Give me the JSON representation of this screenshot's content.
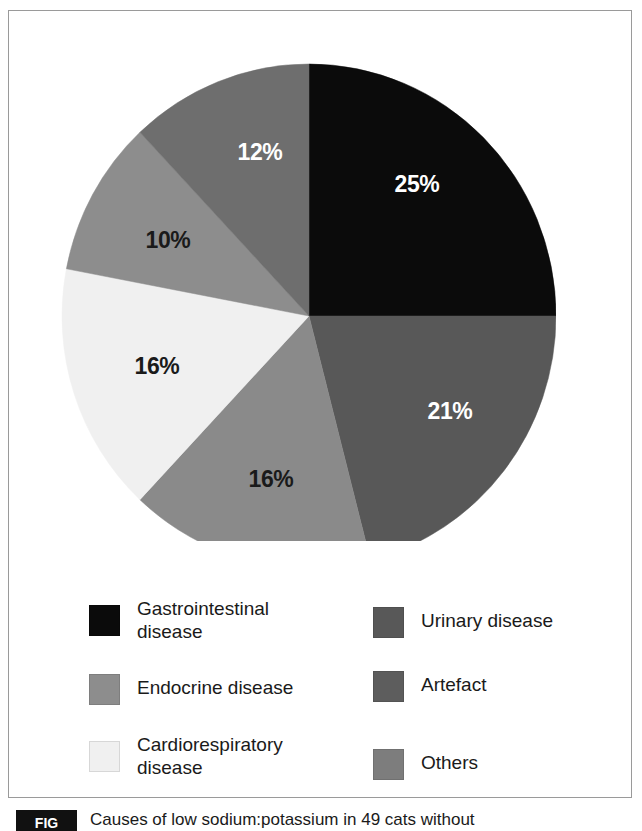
{
  "figure": {
    "caption_tag": "FIG",
    "caption_text": "Causes of low sodium:potassium in 49 cats without"
  },
  "colors": {
    "gastrointestinal": "#0b0b0b",
    "urinary": "#585858",
    "artefact": "#8a8a8a",
    "cardiorespiratory": "#f0f0f0",
    "endocrine": "#8d8d8d",
    "others": "#6e6e6e",
    "frame": "#9a9a9a",
    "label_on_dark": "#ffffff",
    "label_on_light": "#1a1a1a"
  },
  "chart_data": {
    "type": "pie",
    "title": "Causes of low sodium:potassium in 49 cats without",
    "xlabel": "",
    "ylabel": "",
    "grid": false,
    "legend_position": "bottom",
    "start_angle_deg": 0,
    "direction": "clockwise",
    "total_label": "100%",
    "labels": [
      "Gastrointestinal disease",
      "Urinary disease",
      "Artefact",
      "Cardiorespiratory disease",
      "Endocrine disease",
      "Others"
    ],
    "values": [
      25,
      21,
      16,
      16,
      10,
      12
    ],
    "slices": [
      {
        "label": "Gastrointestinal disease",
        "value": 25,
        "display": "25%",
        "color": "#0b0b0b",
        "text_color": "#ffffff",
        "label_x": 408,
        "label_y": 173
      },
      {
        "label": "Urinary disease",
        "value": 21,
        "display": "21%",
        "color": "#585858",
        "text_color": "#ffffff",
        "label_x": 441,
        "label_y": 400
      },
      {
        "label": "Artefact",
        "value": 16,
        "display": "16%",
        "color": "#8a8a8a",
        "text_color": "#1a1a1a",
        "label_x": 262,
        "label_y": 468
      },
      {
        "label": "Cardiorespiratory disease",
        "value": 16,
        "display": "16%",
        "color": "#f0f0f0",
        "text_color": "#1a1a1a",
        "label_x": 148,
        "label_y": 355
      },
      {
        "label": "Endocrine disease",
        "value": 10,
        "display": "10%",
        "color": "#8d8d8d",
        "text_color": "#1a1a1a",
        "label_x": 159,
        "label_y": 229
      },
      {
        "label": "Others",
        "value": 12,
        "display": "12%",
        "color": "#6e6e6e",
        "text_color": "#ffffff",
        "label_x": 251,
        "label_y": 141
      }
    ]
  },
  "legend": {
    "left_column": [
      {
        "label": "Gastrointestinal\ndisease",
        "color": "#0b0b0b",
        "multiline": true
      },
      {
        "label": "Endocrine disease",
        "color": "#8d8d8d",
        "multiline": false
      },
      {
        "label": "Cardiorespiratory\ndisease",
        "color": "#f0f0f0",
        "multiline": true
      }
    ],
    "right_column": [
      {
        "label": "Urinary disease",
        "color": "#585858",
        "multiline": false
      },
      {
        "label": "Artefact",
        "color": "#5d5d5d",
        "multiline": false
      },
      {
        "label": "Others",
        "color": "#7d7d7d",
        "multiline": false
      }
    ]
  }
}
